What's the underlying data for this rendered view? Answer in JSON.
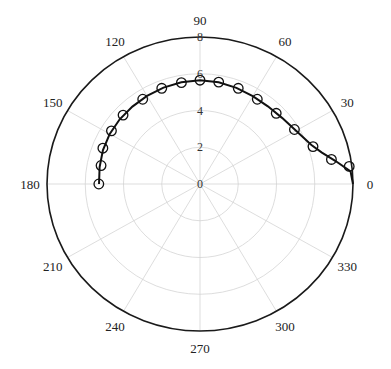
{
  "chart_data": {
    "type": "scatter",
    "subtype": "polar",
    "title": "",
    "theta_unit": "degrees",
    "theta_ticks": [
      0,
      30,
      60,
      90,
      120,
      150,
      180,
      210,
      240,
      270,
      300,
      330
    ],
    "theta_tick_labels": [
      "0",
      "30",
      "60",
      "90",
      "120",
      "150",
      "180",
      "210",
      "240",
      "270",
      "300",
      "330"
    ],
    "r_ticks": [
      0,
      2,
      4,
      6,
      8
    ],
    "r_tick_labels": [
      "0",
      "2",
      "4",
      "6",
      "8"
    ],
    "rlim": [
      0,
      8
    ],
    "grid": true,
    "legend": null,
    "series": [
      {
        "name": "measured",
        "style": "open-circle-markers",
        "theta": [
          7,
          11,
          19,
          31,
          44,
          57,
          69,
          80,
          90,
          100,
          111,
          123,
          137,
          148,
          159,
          169,
          180
        ],
        "r": [
          7.86,
          7.0,
          6.25,
          5.76,
          5.54,
          5.5,
          5.58,
          5.63,
          5.65,
          5.6,
          5.58,
          5.5,
          5.5,
          5.46,
          5.44,
          5.27,
          5.29
        ]
      },
      {
        "name": "fit",
        "style": "solid-line",
        "theta": [
          0,
          5,
          10,
          15,
          20,
          30,
          40,
          50,
          60,
          70,
          80,
          90,
          100,
          110,
          120,
          130,
          140,
          150,
          160,
          170,
          180
        ],
        "r": [
          8.0,
          7.9,
          7.2,
          6.6,
          6.2,
          5.8,
          5.6,
          5.52,
          5.52,
          5.57,
          5.62,
          5.65,
          5.62,
          5.58,
          5.54,
          5.5,
          5.48,
          5.45,
          5.4,
          5.33,
          5.28
        ]
      }
    ]
  },
  "layout": {
    "center": [
      200,
      184
    ],
    "radius_x": 153,
    "radius_y": 147
  }
}
